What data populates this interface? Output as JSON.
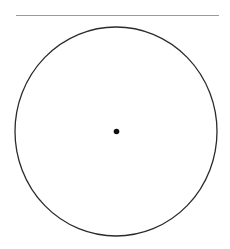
{
  "figure": {
    "canvas": {
      "width": 230,
      "height": 249,
      "background_color": "#ffffff"
    },
    "elements": {
      "top_line": {
        "label": "horizontal line",
        "x1": 16,
        "y1": 15.5,
        "x2": 219,
        "y2": 15.5,
        "stroke_color": "#9a9a9a",
        "stroke_width": 1.1
      },
      "circle": {
        "label": "circle outline",
        "center_x": 116,
        "center_y": 131.5,
        "radius_x": 101,
        "radius_y": 104.5,
        "stroke_color": "#2b2b2b",
        "fill_color": "none",
        "stroke_width": 1.3
      },
      "center_dot": {
        "label": "centre point",
        "center_x": 116.5,
        "center_y": 131.5,
        "radius": 2.8,
        "fill_color": "#111111"
      }
    }
  }
}
